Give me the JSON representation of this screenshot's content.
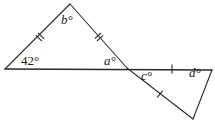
{
  "figure": {
    "name": "angle-diagram",
    "stroke_color": "#2b2b2b",
    "label_color": "#1a1a1a",
    "background_color": "#ffffff",
    "stroke_width": 1.1
  },
  "labels": [
    {
      "id": "angle-a",
      "text": "a°",
      "x": 104,
      "y": 54,
      "italic": true
    },
    {
      "id": "angle-b",
      "text": "b°",
      "x": 61,
      "y": 13,
      "italic": true
    },
    {
      "id": "angle-c",
      "text": "c°",
      "x": 141,
      "y": 69,
      "italic": true
    },
    {
      "id": "angle-d",
      "text": "d°",
      "x": 189,
      "y": 66,
      "italic": true
    },
    {
      "id": "angle-42",
      "text": "42°",
      "x": 21,
      "y": 54,
      "italic": false
    }
  ],
  "vertices": {
    "left_vertex": {
      "x": 5,
      "y": 69
    },
    "apex": {
      "x": 70,
      "y": 4
    },
    "crossing_point": {
      "x": 127,
      "y": 68
    },
    "right_line_end": {
      "x": 212,
      "y": 70
    },
    "bottom_vertex": {
      "x": 193,
      "y": 119
    }
  },
  "segments": [
    {
      "id": "baseline",
      "from": "left_vertex",
      "to": "right_line_end",
      "ticks": 0
    },
    {
      "id": "left-leg",
      "from": "left_vertex",
      "to": "apex",
      "ticks": 2
    },
    {
      "id": "right-leg",
      "from": "apex",
      "to": "crossing_point",
      "ticks": 2
    },
    {
      "id": "lower-leg",
      "from": "crossing_point",
      "to": "bottom_vertex",
      "ticks": 1
    },
    {
      "id": "right-side",
      "from": "bottom_vertex",
      "to": "right_line_end",
      "ticks": 0
    },
    {
      "id": "baseline-right-span",
      "from": "crossing_point",
      "to": "right_line_end",
      "ticks": 1
    }
  ],
  "tick_marks": [
    {
      "id": "tick-left-leg",
      "x": 40,
      "y": 37,
      "angle": -45,
      "count": 2
    },
    {
      "id": "tick-right-leg",
      "x": 99,
      "y": 37,
      "angle": 48,
      "count": 2
    },
    {
      "id": "tick-lower-leg",
      "x": 160,
      "y": 94,
      "angle": 39,
      "count": 1
    },
    {
      "id": "tick-baseline-right",
      "x": 172,
      "y": 69,
      "angle": 90,
      "count": 1
    }
  ]
}
